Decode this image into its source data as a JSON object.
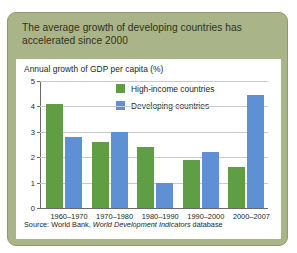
{
  "figure": {
    "title": "The average growth of developing countries has accelerated since 2000",
    "source_prefix": "Source: World Bank, ",
    "source_italic": "World Development Indicators",
    "source_suffix": " database",
    "card_bg": "#a9b488",
    "card_border": "#8e9a6b",
    "panel_bg": "#ffffff"
  },
  "chart_data": {
    "type": "bar",
    "title": "",
    "subtitle": "Annual growth of GDP per capita (%)",
    "xlabel": "",
    "ylabel": "Annual growth of GDP per capita (%)",
    "categories": [
      "1960–1970",
      "1970–1980",
      "1980–1990",
      "1990–2000",
      "2000–2007"
    ],
    "series": [
      {
        "name": "High-income countries",
        "color": "#5f9e45",
        "values": [
          4.1,
          2.6,
          2.4,
          1.9,
          1.6
        ]
      },
      {
        "name": "Developing countries",
        "color": "#5e91d4",
        "values": [
          2.8,
          3.0,
          1.0,
          2.2,
          4.45
        ]
      }
    ],
    "ylim": [
      0,
      5
    ],
    "yticks": [
      0,
      1,
      2,
      3,
      4,
      5
    ],
    "ytick_labels": [
      "0",
      "1",
      "2",
      "3",
      "4",
      "5"
    ],
    "grid": true,
    "grid_axis": "y",
    "legend_position": "top-right-inside"
  }
}
